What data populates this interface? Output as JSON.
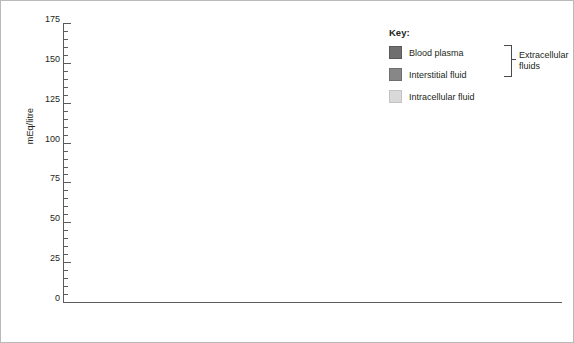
{
  "axis": {
    "y_label": "mEq/litre",
    "y_ticks": [
      0,
      25,
      50,
      75,
      100,
      125,
      150,
      175
    ]
  },
  "legend": {
    "title": "Key:",
    "items": [
      {
        "label": "Blood plasma",
        "color": "#6f6f6f",
        "key": "plasma"
      },
      {
        "label": "Interstitial fluid",
        "color": "#878787",
        "key": "interstitial"
      },
      {
        "label": "Intracellular fluid",
        "color": "#d9d9d9",
        "key": "intracellular"
      }
    ],
    "bracket_label_line1": "Extracellular",
    "bracket_label_line2": "fluids"
  },
  "chart_data": {
    "type": "bar",
    "title": "",
    "xlabel": "",
    "ylabel": "mEq/litre",
    "ylim": [
      0,
      175
    ],
    "ytick_step": 25,
    "yminor_step": 5,
    "grid": false,
    "legend_position": "top-right",
    "categories": [
      "Na+",
      "K+",
      "Ca2+",
      "Mg2+",
      "Cl-",
      "HCO3-",
      "HPO4 2- (organic)",
      "SO4 2-",
      "Protein anions"
    ],
    "category_labels_html": [
      "Na<sup>+</sup>",
      "K<sup>+</sup>",
      "Ca<sup>2+</sup>",
      "Mg<sup>2+</sup>",
      "Cl<sup>&minus;</sup>",
      "HCO<sub>3</sub><sup>&minus;</sup>",
      "HPO<sub>4</sub><sup>2&minus;</sup>|(organic)",
      "SO<sub>4</sub><sup>2&minus;</sup>",
      "Protein|anions"
    ],
    "series": [
      {
        "name": "Blood plasma",
        "values": [
          142,
          4,
          5,
          2,
          100,
          24,
          2,
          1,
          20
        ]
      },
      {
        "name": "Interstitial fluid",
        "values": [
          145,
          4,
          3,
          2,
          117,
          27,
          2,
          1,
          2
        ]
      },
      {
        "name": "Intracellular fluid",
        "values": [
          10,
          140,
          0.2,
          35,
          3,
          15,
          100,
          20,
          50
        ]
      }
    ],
    "value_labels": [
      [
        "142",
        "145",
        "10"
      ],
      [
        "4",
        "4",
        "140"
      ],
      [
        "5",
        "3",
        "0.2"
      ],
      [
        "2",
        "2",
        "35"
      ],
      [
        "100",
        "117",
        "3"
      ],
      [
        "24",
        "27",
        "15"
      ],
      [
        "2",
        "2",
        "100"
      ],
      [
        "1",
        "1",
        "20"
      ],
      [
        "20",
        "2",
        "50"
      ]
    ]
  }
}
